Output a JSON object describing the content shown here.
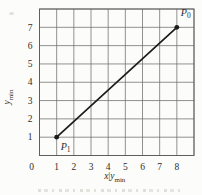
{
  "chart_data": {
    "type": "line",
    "title": "",
    "grid": true,
    "legend": false,
    "x_axis": {
      "min": 0,
      "max": 9,
      "ticks": [
        0,
        1,
        2,
        3,
        4,
        5,
        6,
        7,
        8
      ],
      "title_parts": [
        {
          "text": "x",
          "italic": true
        },
        {
          "text": "|",
          "italic": false
        },
        {
          "text": "y",
          "italic": true
        },
        {
          "text": "min",
          "sub": true
        }
      ]
    },
    "y_axis": {
      "min": 0,
      "max": 8,
      "ticks": [
        1,
        2,
        3,
        4,
        5,
        6,
        7
      ],
      "title_parts": [
        {
          "text": "y",
          "italic": true
        },
        {
          "text": "min",
          "sub": true
        }
      ]
    },
    "series": [
      {
        "name": "segment-P1-P0",
        "color": "#1c1c1c",
        "points": [
          {
            "x": 1,
            "y": 1,
            "label_base": "P",
            "label_sub": "1",
            "label_position": "below-right"
          },
          {
            "x": 8,
            "y": 7,
            "label_base": "P",
            "label_sub": "0",
            "label_position": "above-right"
          }
        ]
      }
    ]
  },
  "colors": {
    "background": "#fcfcfa",
    "grid": "#6e6e6e",
    "border": "#5a5a5a",
    "line": "#1c1c1c",
    "text": "#2e2e2e"
  }
}
